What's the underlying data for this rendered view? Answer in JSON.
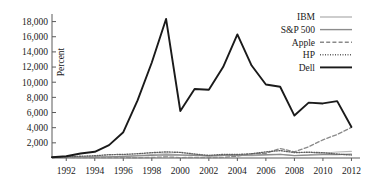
{
  "chart_data": {
    "type": "line",
    "title": "",
    "xlabel": "",
    "ylabel": "Percent",
    "xlim": [
      1991,
      2012.6
    ],
    "ylim": [
      0,
      19000
    ],
    "grid": false,
    "legend_position": "top-right",
    "xticks": [
      "1992",
      "1994",
      "1996",
      "1998",
      "2000",
      "2002",
      "2004",
      "2006",
      "2008",
      "2010",
      "2012"
    ],
    "xtick_values": [
      1992,
      1994,
      1996,
      1998,
      2000,
      2002,
      2004,
      2006,
      2008,
      2010,
      2012
    ],
    "yticks": [
      "2,000",
      "4,000",
      "6,000",
      "8,000",
      "10,000",
      "12,000",
      "14,000",
      "16,000",
      "18,000"
    ],
    "ytick_values": [
      2000,
      4000,
      6000,
      8000,
      10000,
      12000,
      14000,
      16000,
      18000
    ],
    "x": [
      1991,
      1992,
      1993,
      1994,
      1995,
      1996,
      1997,
      1998,
      1999,
      2000,
      2001,
      2002,
      2003,
      2004,
      2005,
      2006,
      2007,
      2008,
      2009,
      2010,
      2011,
      2012
    ],
    "series": [
      {
        "name": "IBM",
        "color": "#b8b8b8",
        "style": "solid",
        "width": 1.1,
        "values": [
          100,
          95,
          70,
          110,
          160,
          215,
          330,
          470,
          560,
          420,
          400,
          250,
          330,
          330,
          300,
          360,
          500,
          320,
          430,
          620,
          800,
          880
        ]
      },
      {
        "name": "S&P 500",
        "color": "#8c8c8c",
        "style": "solid",
        "width": 1.2,
        "values": [
          100,
          108,
          118,
          120,
          164,
          202,
          269,
          346,
          419,
          381,
          336,
          261,
          336,
          373,
          391,
          453,
          478,
          301,
          381,
          438,
          447,
          519
        ]
      },
      {
        "name": "Apple",
        "color": "#8a8a8a",
        "style": "dashed",
        "width": 1.3,
        "values": [
          100,
          80,
          60,
          70,
          60,
          40,
          30,
          75,
          145,
          60,
          70,
          50,
          75,
          230,
          560,
          620,
          1250,
          820,
          1480,
          2400,
          3100,
          4050
        ]
      },
      {
        "name": "HP",
        "color": "#606060",
        "style": "dotted",
        "width": 1.4,
        "values": [
          100,
          160,
          230,
          300,
          430,
          470,
          560,
          700,
          800,
          740,
          520,
          340,
          480,
          460,
          560,
          800,
          980,
          720,
          760,
          700,
          520,
          390
        ]
      },
      {
        "name": "Dell",
        "color": "#1a1a1a",
        "style": "solid",
        "width": 1.9,
        "values": [
          100,
          230,
          600,
          820,
          1700,
          3400,
          7600,
          12600,
          18350,
          6200,
          9100,
          9000,
          12000,
          16300,
          12200,
          9700,
          9400,
          5600,
          7300,
          7200,
          7500,
          4100
        ]
      }
    ]
  },
  "legend": {
    "items": [
      {
        "label": "IBM"
      },
      {
        "label": "S&P 500"
      },
      {
        "label": "Apple"
      },
      {
        "label": "HP"
      },
      {
        "label": "Dell"
      }
    ]
  },
  "axes": {
    "y_axis_title": "Percent"
  }
}
